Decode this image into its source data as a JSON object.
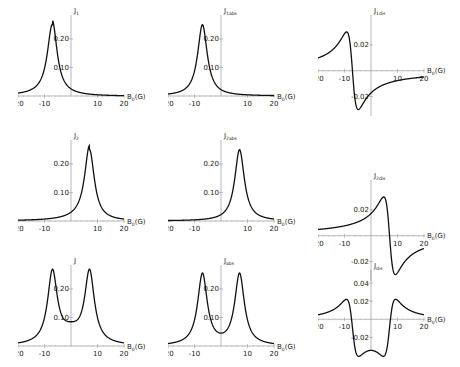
{
  "chart_data": [
    {
      "type": "line",
      "ylabel": "J_1",
      "ylabel_main": "J",
      "ylabel_sub": "1",
      "xlabel_main": "B",
      "xlabel_sub": "0",
      "xlabel_unit": "(G)",
      "xlim": [
        -20,
        20
      ],
      "ylim": [
        0,
        0.27
      ],
      "yticks": [
        "0.20",
        "0.10"
      ],
      "yvals": [
        0.2,
        0.1
      ],
      "xticks": [
        "-20",
        "-10",
        "10",
        "20"
      ],
      "xvals": [
        -20,
        -10,
        10,
        20
      ],
      "curve": "lorentz_left_asym"
    },
    {
      "type": "line",
      "ylabel": "J_1abs",
      "ylabel_main": "J",
      "ylabel_sub": "1abs",
      "xlabel_main": "B",
      "xlabel_sub": "0",
      "xlabel_unit": "(G)",
      "xlim": [
        -20,
        20
      ],
      "ylim": [
        0,
        0.27
      ],
      "yticks": [
        "0.20",
        "0.10"
      ],
      "yvals": [
        0.2,
        0.1
      ],
      "xticks": [
        "-20",
        "-10",
        "10",
        "20"
      ],
      "xvals": [
        -20,
        -10,
        10,
        20
      ],
      "curve": "lorentz_left"
    },
    {
      "type": "line",
      "ylabel": "J_1dis",
      "ylabel_main": "J",
      "ylabel_sub": "1dis",
      "xlabel_main": "B",
      "xlabel_sub": "0",
      "xlabel_unit": "(G)",
      "xlim": [
        -20,
        20
      ],
      "ylim": [
        -0.035,
        0.04
      ],
      "yticks": [
        "0.02",
        "-0.02"
      ],
      "yvals": [
        0.02,
        -0.02
      ],
      "xticks": [
        "-20",
        "-10",
        "10",
        "20"
      ],
      "xvals": [
        -20,
        -10,
        10,
        20
      ],
      "curve": "disp_left"
    },
    {
      "type": "line",
      "ylabel": "J_2",
      "ylabel_main": "J",
      "ylabel_sub": "2",
      "xlabel_main": "B",
      "xlabel_sub": "0",
      "xlabel_unit": "(G)",
      "xlim": [
        -20,
        20
      ],
      "ylim": [
        0,
        0.27
      ],
      "yticks": [
        "0.20",
        "0.10"
      ],
      "yvals": [
        0.2,
        0.1
      ],
      "xticks": [
        "-20",
        "-10",
        "10",
        "20"
      ],
      "xvals": [
        -20,
        -10,
        10,
        20
      ],
      "curve": "lorentz_right_asym"
    },
    {
      "type": "line",
      "ylabel": "J_2abs",
      "ylabel_main": "J",
      "ylabel_sub": "2abs",
      "xlabel_main": "B",
      "xlabel_sub": "0",
      "xlabel_unit": "(G)",
      "xlim": [
        -20,
        20
      ],
      "ylim": [
        0,
        0.27
      ],
      "yticks": [
        "0.20",
        "0.10"
      ],
      "yvals": [
        0.2,
        0.1
      ],
      "xticks": [
        "-20",
        "-10",
        "10",
        "20"
      ],
      "xvals": [
        -20,
        -10,
        10,
        20
      ],
      "curve": "lorentz_right"
    },
    {
      "type": "line",
      "ylabel": "J_2dis",
      "ylabel_main": "J",
      "ylabel_sub": "2dis",
      "xlabel_main": "B",
      "xlabel_sub": "0",
      "xlabel_unit": "(G)",
      "xlim": [
        -20,
        20
      ],
      "ylim": [
        -0.035,
        0.04
      ],
      "yticks": [
        "0.02",
        "-0.02"
      ],
      "yvals": [
        0.02,
        -0.02
      ],
      "xticks": [
        "-20",
        "-10",
        "10",
        "20"
      ],
      "xvals": [
        -20,
        -10,
        10,
        20
      ],
      "curve": "disp_right"
    },
    {
      "type": "line",
      "ylabel": "J",
      "ylabel_main": "J",
      "ylabel_sub": "",
      "xlabel_main": "B",
      "xlabel_sub": "0",
      "xlabel_unit": "(G)",
      "xlim": [
        -20,
        20
      ],
      "ylim": [
        0,
        0.27
      ],
      "yticks": [
        "0.20",
        "0.10"
      ],
      "yvals": [
        0.2,
        0.1
      ],
      "xticks": [
        "-20",
        "-10",
        "10",
        "20"
      ],
      "xvals": [
        -20,
        -10,
        10,
        20
      ],
      "curve": "double_sum"
    },
    {
      "type": "line",
      "ylabel": "J_abs",
      "ylabel_main": "J",
      "ylabel_sub": "abs",
      "xlabel_main": "B",
      "xlabel_sub": "0",
      "xlabel_unit": "(G)",
      "xlim": [
        -20,
        20
      ],
      "ylim": [
        0,
        0.27
      ],
      "yticks": [
        "0.20",
        "0.10"
      ],
      "yvals": [
        0.2,
        0.1
      ],
      "xticks": [
        "-20",
        "-10",
        "10",
        "20"
      ],
      "xvals": [
        -20,
        -10,
        10,
        20
      ],
      "curve": "double_abs"
    },
    {
      "type": "line",
      "ylabel": "J_dis",
      "ylabel_main": "J",
      "ylabel_sub": "dis",
      "xlabel_main": "B",
      "xlabel_sub": "0",
      "xlabel_unit": "(G)",
      "xlim": [
        -20,
        20
      ],
      "ylim": [
        -0.035,
        0.05
      ],
      "yticks": [
        "0.04",
        "0.02",
        "-0.02"
      ],
      "yvals": [
        0.04,
        0.02,
        -0.02
      ],
      "xticks": [
        "-20",
        "-10",
        "10",
        "20"
      ],
      "xvals": [
        -20,
        -10,
        10,
        20
      ],
      "curve": "double_dis"
    }
  ],
  "layout": {
    "panels": [
      {
        "left": 18,
        "top": 5,
        "width": 130,
        "height": 105
      },
      {
        "left": 168,
        "top": 5,
        "width": 130,
        "height": 105
      },
      {
        "left": 318,
        "top": 5,
        "width": 130,
        "height": 125
      },
      {
        "left": 18,
        "top": 130,
        "width": 130,
        "height": 105
      },
      {
        "left": 168,
        "top": 130,
        "width": 130,
        "height": 105
      },
      {
        "left": 318,
        "top": 170,
        "width": 130,
        "height": 125
      },
      {
        "left": 18,
        "top": 255,
        "width": 130,
        "height": 105
      },
      {
        "left": 168,
        "top": 255,
        "width": 130,
        "height": 105
      },
      {
        "left": 318,
        "top": 260,
        "width": 130,
        "height": 105
      }
    ]
  }
}
